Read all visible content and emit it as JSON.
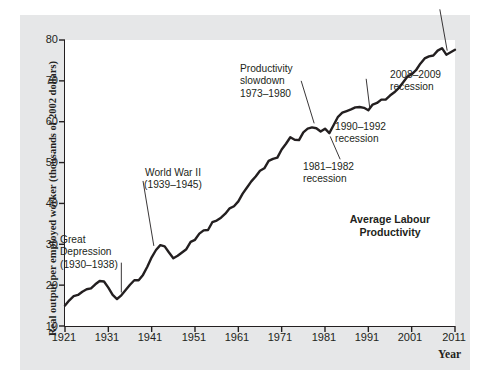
{
  "figure": {
    "background_color": "#e6e7e8",
    "plot_background_color": "#ffffff",
    "line_color": "#231f20"
  },
  "axis": {
    "y_title": "Real output per employed worker\n(thousands of 2002 dollars)",
    "x_title": "Year",
    "y_ticks": [
      "10",
      "20",
      "30",
      "40",
      "50",
      "60",
      "70",
      "80"
    ],
    "x_ticks": [
      "1921",
      "1931",
      "1941",
      "1951",
      "1961",
      "1971",
      "1981",
      "1991",
      "2001",
      "2011"
    ]
  },
  "series_label": "Average Labour\nProductivity",
  "annotations": [
    {
      "id": "great-depression",
      "text": "Great\nDepression\n(1930–1938)"
    },
    {
      "id": "world-war-two",
      "text": "World War II\n(1939–1945)"
    },
    {
      "id": "productivity-slowdown",
      "text": "Productivity\nslowdown\n1973–1980"
    },
    {
      "id": "recession-1981-1982",
      "text": "1981–1982\nrecession"
    },
    {
      "id": "recession-1990-1992",
      "text": "1990–1992\nrecession"
    },
    {
      "id": "recession-2008-2009",
      "text": "2008–2009\nrecession"
    }
  ],
  "chart_data": {
    "type": "line",
    "title": "",
    "xlabel": "Year",
    "ylabel": "Real output per employed worker (thousands of 2002 dollars)",
    "xlim": [
      1921,
      2011
    ],
    "ylim": [
      10,
      80
    ],
    "grid": false,
    "legend_position": "inline-right",
    "series": [
      {
        "name": "Average Labour Productivity",
        "x": [
          1921,
          1922,
          1923,
          1924,
          1925,
          1926,
          1927,
          1928,
          1929,
          1930,
          1931,
          1932,
          1933,
          1934,
          1935,
          1936,
          1937,
          1938,
          1939,
          1940,
          1941,
          1942,
          1943,
          1944,
          1945,
          1946,
          1947,
          1948,
          1949,
          1950,
          1951,
          1952,
          1953,
          1954,
          1955,
          1956,
          1957,
          1958,
          1959,
          1960,
          1961,
          1962,
          1963,
          1964,
          1965,
          1966,
          1967,
          1968,
          1969,
          1970,
          1971,
          1972,
          1973,
          1974,
          1975,
          1976,
          1977,
          1978,
          1979,
          1980,
          1981,
          1982,
          1983,
          1984,
          1985,
          1986,
          1987,
          1988,
          1989,
          1990,
          1991,
          1992,
          1993,
          1994,
          1995,
          1996,
          1997,
          1998,
          1999,
          2000,
          2001,
          2002,
          2003,
          2004,
          2005,
          2006,
          2007,
          2008,
          2009,
          2010,
          2011
        ],
        "y": [
          15.0,
          16.3,
          17.3,
          17.6,
          18.4,
          19.0,
          19.2,
          20.2,
          21.0,
          20.9,
          19.4,
          17.6,
          16.6,
          17.5,
          18.8,
          20.1,
          21.2,
          21.2,
          22.5,
          24.5,
          26.8,
          28.6,
          29.8,
          29.5,
          28.0,
          26.6,
          27.2,
          28.0,
          28.8,
          30.6,
          31.1,
          32.6,
          33.4,
          33.5,
          35.4,
          35.8,
          36.5,
          37.5,
          38.8,
          39.3,
          40.5,
          42.4,
          43.9,
          45.4,
          46.6,
          48.0,
          48.6,
          50.4,
          50.9,
          51.2,
          53.2,
          54.6,
          56.2,
          55.6,
          55.5,
          57.4,
          58.3,
          58.6,
          58.4,
          57.6,
          58.3,
          57.2,
          59.2,
          61.2,
          62.2,
          62.6,
          63.0,
          63.5,
          63.6,
          63.4,
          62.8,
          64.2,
          64.6,
          65.4,
          65.4,
          66.4,
          67.2,
          68.2,
          69.6,
          71.0,
          71.6,
          72.6,
          74.2,
          75.5,
          76.0,
          76.2,
          77.4,
          78.0,
          76.4,
          77.0,
          77.6
        ]
      }
    ],
    "annotations": [
      {
        "label": "Great Depression (1930–1938)",
        "x": 1934,
        "y": 16.8
      },
      {
        "label": "World War II (1939–1945)",
        "x": 1942,
        "y": 29.0
      },
      {
        "label": "Productivity slowdown 1973–1980",
        "x": 1977,
        "y": 58.0
      },
      {
        "label": "1981–1982 recession",
        "x": 1982,
        "y": 57.2
      },
      {
        "label": "1990–1992 recession",
        "x": 1991,
        "y": 62.8
      },
      {
        "label": "2008–2009 recession",
        "x": 2009,
        "y": 76.4
      }
    ]
  }
}
